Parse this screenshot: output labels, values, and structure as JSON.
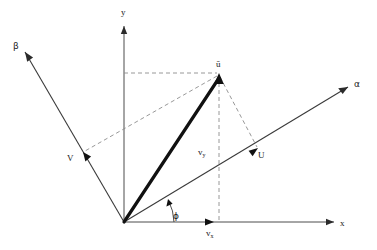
{
  "figure": {
    "background_color": "#ffffff",
    "width": 377,
    "height": 250
  },
  "colors": {
    "axis": "#4d4d4d",
    "vector": "#111111",
    "dashed": "#8c8c8c",
    "label": "#1a1a1a"
  },
  "origin": {
    "x": 124,
    "y": 222,
    "label": "O"
  },
  "axes": [
    {
      "id": "x-axis",
      "label": "x",
      "label_x": 342,
      "label_y": 225,
      "from": {
        "x": 124,
        "y": 222
      },
      "to": {
        "x": 334,
        "y": 222
      },
      "style": "solid"
    },
    {
      "id": "y-axis",
      "label": "y",
      "label_x": 122,
      "label_y": 14,
      "from": {
        "x": 124,
        "y": 222
      },
      "to": {
        "x": 124,
        "y": 26
      },
      "style": "solid"
    },
    {
      "id": "alpha-axis",
      "label": "α",
      "label_x": 356,
      "label_y": 86,
      "from": {
        "x": 124,
        "y": 222
      },
      "to": {
        "x": 348,
        "y": 87
      },
      "style": "solid"
    },
    {
      "id": "beta-axis",
      "label": "β",
      "label_x": 15,
      "label_y": 48,
      "from": {
        "x": 124,
        "y": 222
      },
      "to": {
        "x": 25,
        "y": 52
      },
      "style": "solid"
    }
  ],
  "vectors": [
    {
      "id": "u-vector",
      "label": "ū",
      "label_x": 219,
      "label_y": 66,
      "from": {
        "x": 124,
        "y": 222
      },
      "to": {
        "x": 219,
        "y": 74
      },
      "style": "bold-solid"
    },
    {
      "id": "u-component-alpha",
      "label": "U",
      "label_x": 262,
      "label_y": 158,
      "from": {
        "x": 124,
        "y": 222
      },
      "to": {
        "x": 258,
        "y": 148
      },
      "style": "solid-on-alpha"
    },
    {
      "id": "v-component-beta",
      "label": "V",
      "label_x": 70,
      "label_y": 160,
      "from": {
        "x": 124,
        "y": 222
      },
      "to": {
        "x": 83,
        "y": 152
      },
      "style": "solid-on-beta"
    },
    {
      "id": "vx-component",
      "label": "v",
      "sublabel": "x",
      "label_x": 208,
      "label_y": 235,
      "from": {
        "x": 124,
        "y": 222
      },
      "to": {
        "x": 212,
        "y": 222
      },
      "style": "solid-on-x"
    },
    {
      "id": "vy-component",
      "label": "v",
      "sublabel": "y",
      "label_x": 200,
      "label_y": 154,
      "from": {
        "x": 219,
        "y": 222
      },
      "to": {
        "x": 219,
        "y": 74
      },
      "style": "dashed-vertical"
    }
  ],
  "projection_lines": [
    {
      "id": "horizontal-projection-to-y-axis",
      "from": {
        "x": 124,
        "y": 73
      },
      "to": {
        "x": 219,
        "y": 73
      },
      "style": "dashed"
    },
    {
      "id": "vertical-projection-to-x-axis",
      "from": {
        "x": 219,
        "y": 74
      },
      "to": {
        "x": 219,
        "y": 222
      },
      "style": "dashed"
    },
    {
      "id": "parallelogram-side-to-v",
      "from": {
        "x": 219,
        "y": 74
      },
      "to": {
        "x": 83,
        "y": 152
      },
      "style": "dashed"
    },
    {
      "id": "parallelogram-side-to-u",
      "from": {
        "x": 219,
        "y": 74
      },
      "to": {
        "x": 258,
        "y": 148
      },
      "style": "dashed"
    }
  ],
  "angle": {
    "id": "phi-angle",
    "label": "ϕ",
    "label_x": 175,
    "label_y": 218,
    "vertex": {
      "x": 124,
      "y": 222
    },
    "between": [
      "x-axis",
      "alpha-axis"
    ],
    "radius": 50
  },
  "labels": {
    "x_axis": "x",
    "y_axis": "y",
    "alpha_axis": "α",
    "beta_axis": "β",
    "u_vector": "ū",
    "u_component": "U",
    "v_component": "V",
    "vx_component": "v",
    "vx_subscript": "x",
    "vy_component": "v",
    "vy_subscript": "y",
    "phi_angle": "ϕ"
  }
}
